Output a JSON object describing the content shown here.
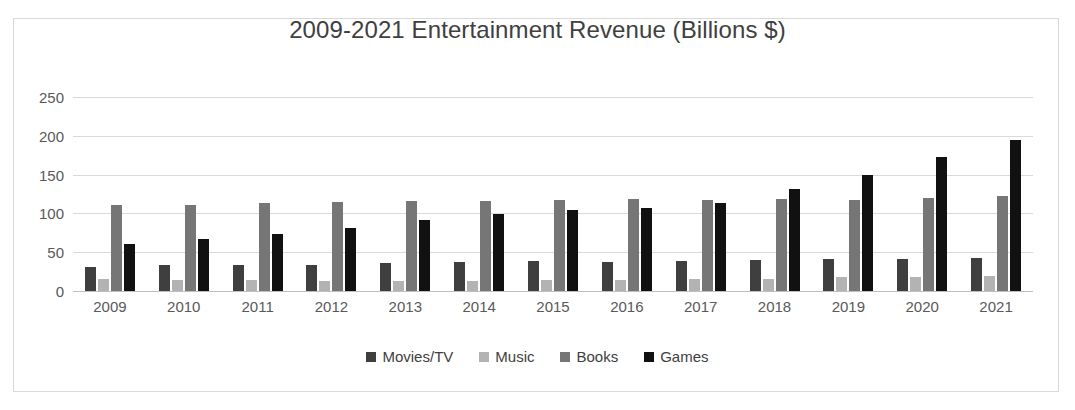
{
  "chart_data": {
    "type": "bar",
    "title": "2009-2021 Entertainment Revenue (Billions $)",
    "xlabel": "",
    "ylabel": "",
    "ylim": [
      0,
      250
    ],
    "yticks": [
      0,
      50,
      100,
      150,
      200,
      250
    ],
    "grid": true,
    "legend_position": "bottom",
    "categories": [
      "2009",
      "2010",
      "2011",
      "2012",
      "2013",
      "2014",
      "2015",
      "2016",
      "2017",
      "2018",
      "2019",
      "2020",
      "2021"
    ],
    "series": [
      {
        "name": "Movies/TV",
        "color": "#3f3f3f",
        "values": [
          31,
          33,
          34,
          34,
          36,
          38,
          39,
          38,
          39,
          40,
          41,
          41,
          43
        ]
      },
      {
        "name": "Music",
        "color": "#b3b3b3",
        "values": [
          15,
          14,
          14,
          13,
          13,
          13,
          14,
          14,
          15,
          16,
          18,
          18,
          19
        ]
      },
      {
        "name": "Books",
        "color": "#767676",
        "values": [
          111,
          111,
          114,
          115,
          116,
          116,
          117,
          118,
          117,
          118,
          117,
          120,
          123
        ]
      },
      {
        "name": "Games",
        "color": "#111111",
        "values": [
          61,
          67,
          73,
          81,
          91,
          99,
          105,
          107,
          114,
          131,
          150,
          173,
          195
        ]
      }
    ]
  },
  "legend": {
    "items": [
      {
        "label": "Movies/TV",
        "color": "#3f3f3f"
      },
      {
        "label": "Music",
        "color": "#b3b3b3"
      },
      {
        "label": "Books",
        "color": "#767676"
      },
      {
        "label": "Games",
        "color": "#111111"
      }
    ]
  }
}
